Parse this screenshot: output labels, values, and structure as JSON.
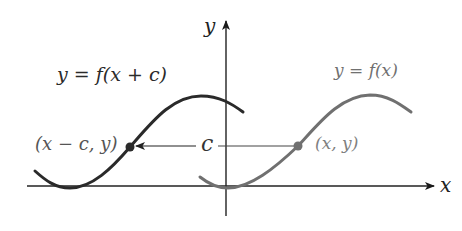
{
  "diagram": {
    "axes": {
      "x_label": "x",
      "y_label": "y"
    },
    "curves": [
      {
        "name": "original",
        "label": "y = f(x)",
        "color": "#707070"
      },
      {
        "name": "shifted",
        "label": "y = f(x + c)",
        "color": "#2a2a2a"
      }
    ],
    "points": [
      {
        "name": "original-point",
        "label": "(x, y)",
        "color": "#707070"
      },
      {
        "name": "shifted-point",
        "label": "(x − c, y)",
        "color": "#2a2a2a"
      }
    ],
    "shift_label": "c"
  }
}
